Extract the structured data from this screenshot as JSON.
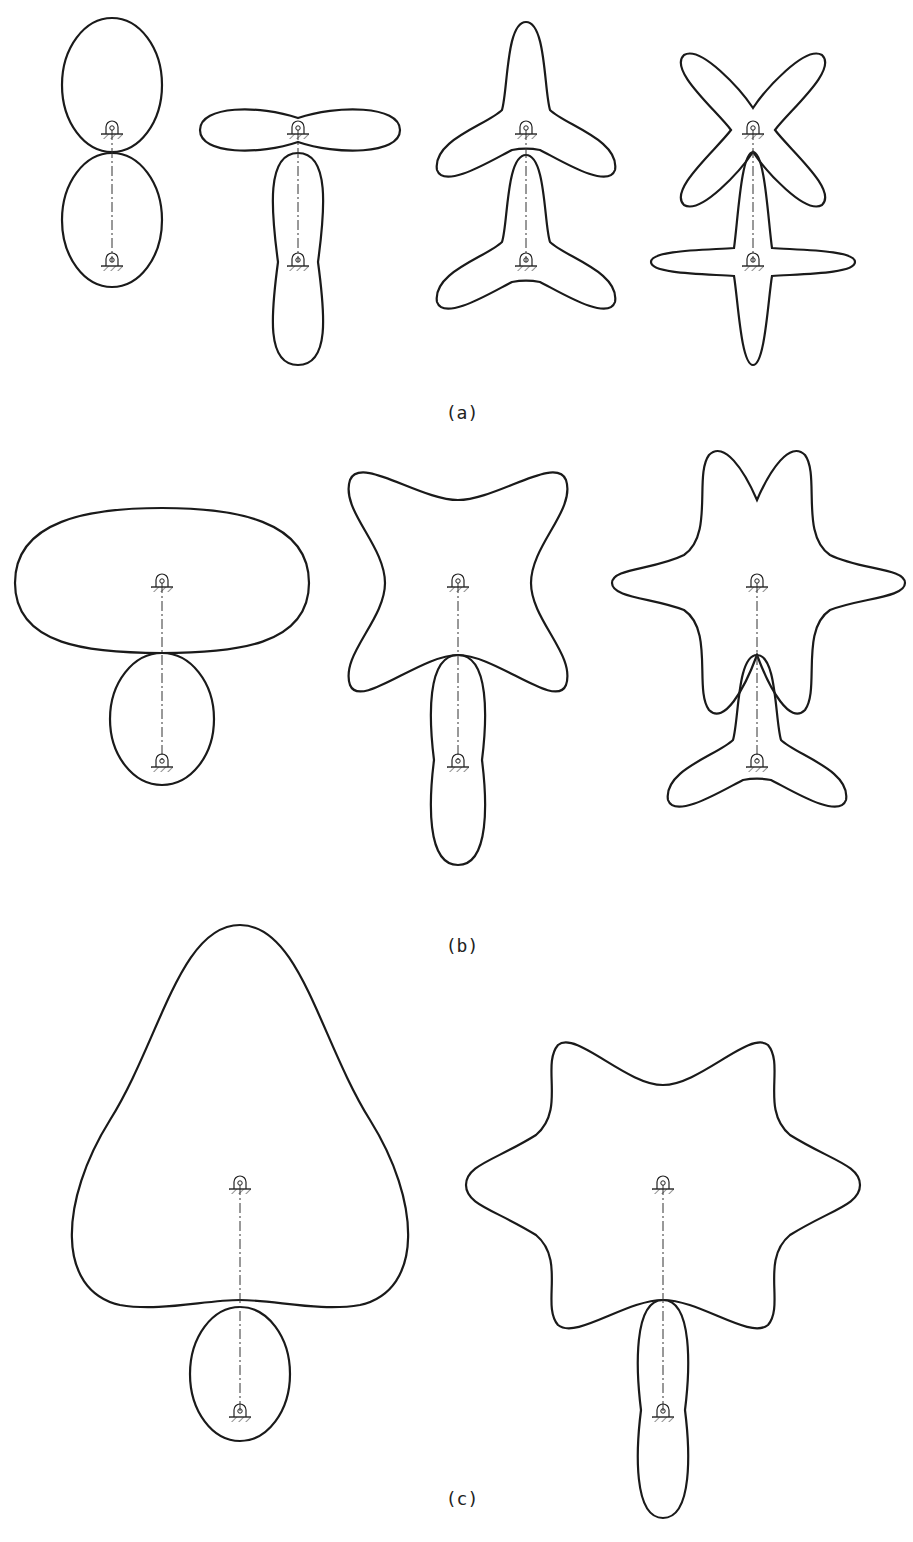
{
  "labels": {
    "a": "(a)",
    "b": "(b)",
    "c": "(c)"
  },
  "colors": {
    "stroke": "#1a1a1a",
    "background": "#ffffff"
  },
  "figures": {
    "a": [
      {
        "driver": {
          "lobes": 1,
          "cx": 112,
          "cy": 130
        },
        "driven": {
          "lobes": 1,
          "cx": 112,
          "cy": 262
        }
      },
      {
        "driver": {
          "lobes": 2,
          "cx": 298,
          "cy": 130
        },
        "driven": {
          "lobes": 2,
          "cx": 298,
          "cy": 262
        }
      },
      {
        "driver": {
          "lobes": 3,
          "cx": 526,
          "cy": 130
        },
        "driven": {
          "lobes": 3,
          "cx": 526,
          "cy": 262
        }
      },
      {
        "driver": {
          "lobes": 4,
          "cx": 753,
          "cy": 130
        },
        "driven": {
          "lobes": 4,
          "cx": 753,
          "cy": 262
        }
      }
    ],
    "b": [
      {
        "driver": {
          "lobes": 2,
          "cx": 162,
          "cy": 583
        },
        "driven": {
          "lobes": 1,
          "cx": 162,
          "cy": 763
        }
      },
      {
        "driver": {
          "lobes": 4,
          "cx": 458,
          "cy": 583
        },
        "driven": {
          "lobes": 2,
          "cx": 458,
          "cy": 763
        }
      },
      {
        "driver": {
          "lobes": 6,
          "cx": 757,
          "cy": 583
        },
        "driven": {
          "lobes": 3,
          "cx": 757,
          "cy": 763
        }
      }
    ],
    "c": [
      {
        "driver": {
          "lobes": 3,
          "cx": 240,
          "cy": 1185
        },
        "driven": {
          "lobes": 1,
          "cx": 240,
          "cy": 1413
        }
      },
      {
        "driver": {
          "lobes": 6,
          "cx": 663,
          "cy": 1185
        },
        "driven": {
          "lobes": 2,
          "cx": 663,
          "cy": 1413
        }
      }
    ]
  }
}
